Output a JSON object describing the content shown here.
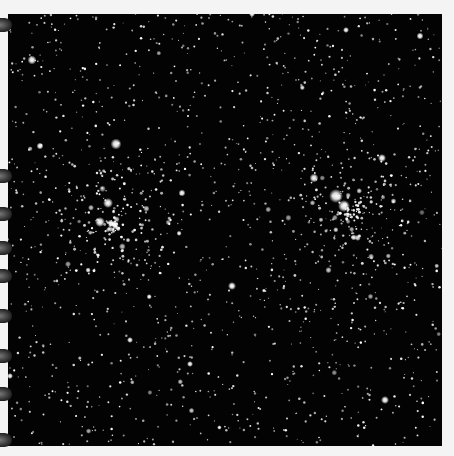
{
  "image": {
    "subject": "star field with two open star clusters",
    "background_color": "#030303",
    "star_color": "#ffffff",
    "frame_color": "#f4f4f4"
  },
  "clusters": [
    {
      "name": "left-cluster",
      "cx": 105,
      "cy": 210,
      "r": 70,
      "count": 170
    },
    {
      "name": "right-cluster",
      "cx": 340,
      "cy": 200,
      "r": 65,
      "count": 170
    }
  ],
  "bright_stars": [
    {
      "x": 32,
      "y": 60,
      "r": 4.5
    },
    {
      "x": 116,
      "y": 144,
      "r": 5.5
    },
    {
      "x": 108,
      "y": 203,
      "r": 5
    },
    {
      "x": 100,
      "y": 222,
      "r": 5
    },
    {
      "x": 182,
      "y": 193,
      "r": 3.5
    },
    {
      "x": 232,
      "y": 286,
      "r": 4
    },
    {
      "x": 252,
      "y": 14,
      "r": 3
    },
    {
      "x": 314,
      "y": 178,
      "r": 4.5
    },
    {
      "x": 336,
      "y": 196,
      "r": 7
    },
    {
      "x": 344,
      "y": 206,
      "r": 6
    },
    {
      "x": 382,
      "y": 158,
      "r": 4
    },
    {
      "x": 420,
      "y": 36,
      "r": 3.5
    },
    {
      "x": 385,
      "y": 400,
      "r": 4
    },
    {
      "x": 10,
      "y": 376,
      "r": 3
    },
    {
      "x": 40,
      "y": 146,
      "r": 3.5
    },
    {
      "x": 190,
      "y": 364,
      "r": 3
    },
    {
      "x": 130,
      "y": 340,
      "r": 3
    },
    {
      "x": 346,
      "y": 30,
      "r": 3
    }
  ],
  "field": {
    "count": 1400,
    "seed": 7
  },
  "scan_edges_y": [
    25,
    176,
    214,
    248,
    276,
    316,
    356,
    394,
    440
  ]
}
